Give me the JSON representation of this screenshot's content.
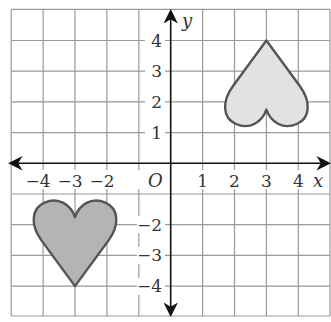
{
  "diagram": {
    "type": "coordinate-grid",
    "axes": {
      "x_label": "x",
      "y_label": "y",
      "origin_label": "O",
      "x_ticks": [
        {
          "value": -4,
          "label": "−4"
        },
        {
          "value": -3,
          "label": "−3"
        },
        {
          "value": -2,
          "label": "−2"
        },
        {
          "value": 1,
          "label": "1"
        },
        {
          "value": 2,
          "label": "2"
        },
        {
          "value": 3,
          "label": "3"
        },
        {
          "value": 4,
          "label": "4"
        }
      ],
      "y_ticks": [
        {
          "value": 4,
          "label": "4"
        },
        {
          "value": 3,
          "label": "3"
        },
        {
          "value": 2,
          "label": "2"
        },
        {
          "value": 1,
          "label": "1"
        },
        {
          "value": -2,
          "label": "−2"
        },
        {
          "value": -3,
          "label": "−3"
        },
        {
          "value": -4,
          "label": "−4"
        }
      ],
      "range_x": [
        -5,
        5
      ],
      "range_y": [
        -5,
        5
      ]
    },
    "shapes": [
      {
        "name": "heart-upper-right",
        "description": "Inverted heart (tip pointing up) in quadrant I",
        "tip": [
          3,
          4
        ],
        "notch": [
          3,
          1.75
        ],
        "fill": "#e2e2e2",
        "stroke": "#555555"
      },
      {
        "name": "heart-lower-left",
        "description": "Upright heart (tip pointing down) in quadrant III",
        "tip": [
          -3,
          -4
        ],
        "notch": [
          -3,
          -1.75
        ],
        "fill": "#b4b4b4",
        "stroke": "#555555"
      }
    ],
    "colors": {
      "grid": "#9a9a9a",
      "axis": "#111111"
    }
  }
}
